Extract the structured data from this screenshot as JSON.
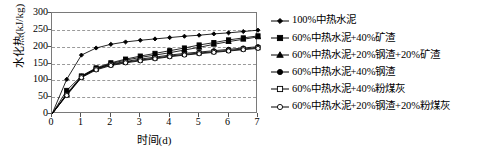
{
  "chart_data": {
    "type": "line",
    "title": "",
    "xlabel": "时间(d)",
    "ylabel": "水化热(kJ/kg)",
    "xlim": [
      0,
      7
    ],
    "ylim": [
      0,
      300
    ],
    "xticks": [
      0,
      1,
      2,
      3,
      4,
      5,
      6,
      7
    ],
    "yticks": [
      0,
      50,
      100,
      150,
      200,
      250,
      300
    ],
    "grid": "horizontal-dashed",
    "legend_position": "right",
    "x": [
      0,
      0.5,
      1,
      1.5,
      2,
      2.5,
      3,
      3.5,
      4,
      4.5,
      5,
      5.5,
      6,
      6.5,
      7
    ],
    "series": [
      {
        "name": "100%中热水泥",
        "marker": "filled-diamond",
        "color": "#000000",
        "values": [
          0,
          103,
          175,
          196,
          207,
          214,
          219,
          223,
          227,
          231,
          234,
          238,
          241,
          245,
          249
        ]
      },
      {
        "name": "60%中热水泥+40%矿渣",
        "marker": "filled-square",
        "color": "#000000",
        "values": [
          0,
          70,
          113,
          137,
          152,
          163,
          172,
          180,
          188,
          196,
          205,
          212,
          220,
          226,
          232
        ]
      },
      {
        "name": "60%中热水泥+20%钢渣+20%矿渣",
        "marker": "filled-triangle",
        "color": "#000000",
        "values": [
          0,
          58,
          110,
          134,
          150,
          160,
          168,
          175,
          182,
          190,
          198,
          207,
          215,
          222,
          229
        ]
      },
      {
        "name": "60%中热水泥+40%钢渣",
        "marker": "filled-circle",
        "color": "#000000",
        "values": [
          0,
          60,
          112,
          135,
          148,
          156,
          163,
          169,
          175,
          180,
          184,
          188,
          192,
          196,
          200
        ]
      },
      {
        "name": "60%中热水泥+40%粉煤灰",
        "marker": "open-square",
        "color": "#000000",
        "values": [
          0,
          57,
          110,
          133,
          146,
          154,
          160,
          166,
          172,
          177,
          181,
          185,
          189,
          193,
          197
        ]
      },
      {
        "name": "60%中热水泥+20%钢渣+20%粉煤灰",
        "marker": "open-circle",
        "color": "#000000",
        "values": [
          0,
          55,
          108,
          131,
          144,
          152,
          158,
          164,
          170,
          175,
          179,
          183,
          187,
          191,
          195
        ]
      }
    ]
  }
}
